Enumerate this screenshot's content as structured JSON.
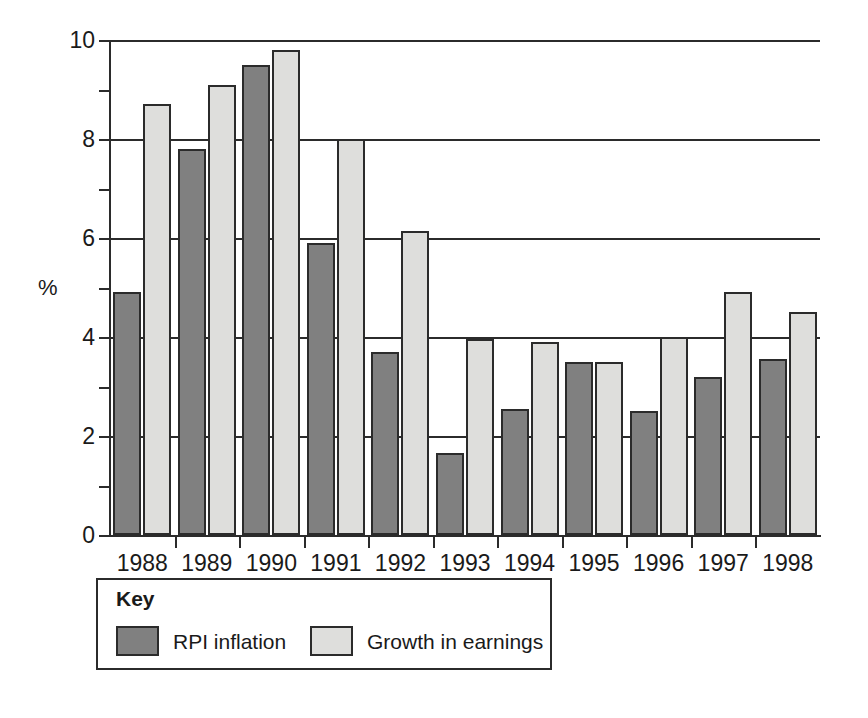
{
  "chart_data": {
    "type": "bar",
    "title": "",
    "subtitle": "",
    "xlabel": "",
    "ylabel": "%",
    "categories": [
      "1988",
      "1989",
      "1990",
      "1991",
      "1992",
      "1993",
      "1994",
      "1995",
      "1996",
      "1997",
      "1998"
    ],
    "series": [
      {
        "name": "RPI inflation",
        "key": "rpi",
        "color": "#808080",
        "values": [
          4.9,
          7.8,
          9.5,
          5.9,
          3.7,
          1.65,
          2.55,
          3.5,
          2.5,
          3.2,
          3.55
        ]
      },
      {
        "name": "Growth in earnings",
        "key": "earn",
        "color": "#dededc",
        "values": [
          8.7,
          9.1,
          9.8,
          8.0,
          6.15,
          3.95,
          3.9,
          3.5,
          4.0,
          4.9,
          4.5
        ]
      }
    ],
    "ylim": [
      0,
      10
    ],
    "y_major_ticks": [
      0,
      2,
      4,
      6,
      8,
      10
    ],
    "y_major_tick_labels": [
      "0",
      "2",
      "4",
      "6",
      "8",
      "10"
    ],
    "y_minor_ticks": [
      1,
      3,
      5,
      7,
      9
    ],
    "grid": "horizontal-major",
    "legend_position": "below-left",
    "legend_title": "Key",
    "bar_outline_color": "#2b2b2b",
    "axis_color": "#2b2b2b",
    "background": "#ffffff"
  },
  "legend": {
    "title": "Key",
    "entries": [
      {
        "label": "RPI inflation",
        "key": "rpi"
      },
      {
        "label": "Growth in earnings",
        "key": "earn"
      }
    ]
  }
}
